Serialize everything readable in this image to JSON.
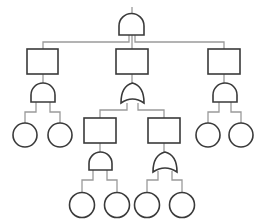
{
  "diagram": {
    "type": "fault-tree",
    "colors": {
      "stroke": "#3a3a3a",
      "connector": "#9a9a9a",
      "background": "#ffffff"
    },
    "nodes": [
      {
        "id": "top-gate",
        "kind": "and-gate",
        "x": 119,
        "y": 14,
        "w": 25,
        "h": 21
      },
      {
        "id": "event-left",
        "kind": "event-box",
        "x": 27,
        "y": 49,
        "w": 31,
        "h": 25
      },
      {
        "id": "event-center",
        "kind": "event-box",
        "x": 116,
        "y": 49,
        "w": 32,
        "h": 25
      },
      {
        "id": "event-right",
        "kind": "event-box",
        "x": 208,
        "y": 49,
        "w": 32,
        "h": 25
      },
      {
        "id": "gate-left",
        "kind": "and-gate",
        "x": 31,
        "y": 83,
        "w": 24,
        "h": 19
      },
      {
        "id": "gate-center",
        "kind": "or-gate",
        "x": 121,
        "y": 83,
        "w": 23,
        "h": 21
      },
      {
        "id": "gate-right",
        "kind": "and-gate",
        "x": 213,
        "y": 83,
        "w": 24,
        "h": 19
      },
      {
        "id": "event-center-left",
        "kind": "event-box",
        "x": 84,
        "y": 118,
        "w": 32,
        "h": 25
      },
      {
        "id": "event-center-right",
        "kind": "event-box",
        "x": 148,
        "y": 118,
        "w": 32,
        "h": 25
      },
      {
        "id": "gate-center-left",
        "kind": "and-gate",
        "x": 89,
        "y": 152,
        "w": 23,
        "h": 18
      },
      {
        "id": "gate-center-right",
        "kind": "or-gate",
        "x": 153,
        "y": 152,
        "w": 24,
        "h": 20
      },
      {
        "id": "basic-1",
        "kind": "basic-event",
        "cx": 25,
        "cy": 135,
        "r": 12
      },
      {
        "id": "basic-2",
        "kind": "basic-event",
        "cx": 60,
        "cy": 135,
        "r": 12
      },
      {
        "id": "basic-3",
        "kind": "basic-event",
        "cx": 208,
        "cy": 135,
        "r": 12
      },
      {
        "id": "basic-4",
        "kind": "basic-event",
        "cx": 241,
        "cy": 135,
        "r": 12
      },
      {
        "id": "basic-5",
        "kind": "basic-event",
        "cx": 82,
        "cy": 205,
        "r": 12.5
      },
      {
        "id": "basic-6",
        "kind": "basic-event",
        "cx": 117,
        "cy": 205,
        "r": 12.5
      },
      {
        "id": "basic-7",
        "kind": "basic-event",
        "cx": 147,
        "cy": 205,
        "r": 12.5
      },
      {
        "id": "basic-8",
        "kind": "basic-event",
        "cx": 182,
        "cy": 205,
        "r": 12.5
      }
    ]
  }
}
